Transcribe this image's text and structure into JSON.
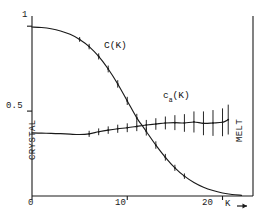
{
  "figure": {
    "background": "#ffffff",
    "ink_color": "#1a1a1a"
  },
  "axes": {
    "y_ticks": [
      {
        "label": "1",
        "value": 1
      },
      {
        "label": "0.5",
        "value": 0.5
      }
    ],
    "x_ticks": [
      {
        "label": "0",
        "value": 0
      },
      {
        "label": "10",
        "value": 10
      },
      {
        "label": "20",
        "value": 20
      }
    ],
    "x_axis_name": "K",
    "x_axis_arrow": "→"
  },
  "phase_labels": {
    "left": "CRYSTAL",
    "right": "MELT"
  },
  "curve_labels": {
    "c_of_k": "C(K)",
    "ca_of_k_base": "c",
    "ca_of_k_sub": "a",
    "ca_of_k_tail": "(K)"
  },
  "chart_data": {
    "type": "line",
    "title": "",
    "subtitle": "",
    "xlabel": "K",
    "ylabel": "",
    "xlim": [
      0,
      23.2
    ],
    "ylim": [
      0,
      1.06
    ],
    "grid": false,
    "legend": "inline-annotations",
    "annotations": [
      {
        "text": "C(K)",
        "x": 8.6,
        "y": 0.78
      },
      {
        "text": "ca(K)",
        "x": 17.0,
        "y": 0.53
      },
      {
        "text": "CRYSTAL",
        "x": 0.0,
        "y": 0.5,
        "rotation": 90
      },
      {
        "text": "MELT",
        "x": 23.2,
        "y": 0.5,
        "rotation": 90
      }
    ],
    "series": [
      {
        "name": "C(K)",
        "x": [
          0.0,
          1.0,
          2.0,
          3.0,
          4.0,
          5.0,
          6.0,
          7.0,
          8.0,
          9.0,
          10.0,
          11.0,
          11.5,
          12.0,
          13.0,
          14.0,
          15.0,
          16.0,
          17.0,
          18.0,
          19.0,
          20.0,
          21.0,
          22.0
        ],
        "values": [
          0.995,
          0.992,
          0.985,
          0.972,
          0.952,
          0.922,
          0.88,
          0.822,
          0.748,
          0.66,
          0.56,
          0.46,
          0.42,
          0.38,
          0.3,
          0.228,
          0.166,
          0.117,
          0.08,
          0.052,
          0.032,
          0.018,
          0.009,
          0.004
        ],
        "errors": [
          0,
          0,
          0,
          0,
          0,
          0.014,
          0.016,
          0.018,
          0.02,
          0.022,
          0.024,
          0.024,
          0,
          0.024,
          0.022,
          0.02,
          0.018,
          0.016,
          0,
          0,
          0,
          0,
          0,
          0
        ],
        "error_x": [
          5.0,
          6.0,
          7.0,
          8.0,
          9.0,
          10.0,
          11.0,
          12.0,
          13.0,
          14.0,
          15.0,
          16.0
        ]
      },
      {
        "name": "ca(K)",
        "x": [
          0.0,
          1.0,
          2.0,
          3.0,
          4.0,
          5.0,
          6.0,
          7.0,
          8.0,
          9.0,
          10.0,
          11.0,
          11.5,
          12.0,
          13.0,
          14.0,
          15.0,
          16.0,
          17.0,
          18.0,
          19.0,
          20.0,
          20.6
        ],
        "values": [
          0.372,
          0.37,
          0.369,
          0.367,
          0.364,
          0.362,
          0.366,
          0.378,
          0.388,
          0.396,
          0.402,
          0.41,
          0.414,
          0.418,
          0.424,
          0.43,
          0.432,
          0.43,
          0.436,
          0.428,
          0.43,
          0.434,
          0.45
        ],
        "errors": [
          0,
          0,
          0,
          0,
          0,
          0,
          0.018,
          0.02,
          0.022,
          0.024,
          0.026,
          0.028,
          0,
          0.03,
          0.034,
          0.038,
          0.044,
          0.052,
          0.062,
          0.07,
          0.076,
          0.082,
          0.088
        ],
        "error_x": [
          6.0,
          7.0,
          8.0,
          9.0,
          10.0,
          11.0,
          12.0,
          13.0,
          14.0,
          15.0,
          16.0,
          17.0,
          18.0,
          19.0,
          20.0,
          20.6
        ]
      }
    ],
    "crossover": {
      "x": 11.5,
      "y": 0.42
    }
  }
}
